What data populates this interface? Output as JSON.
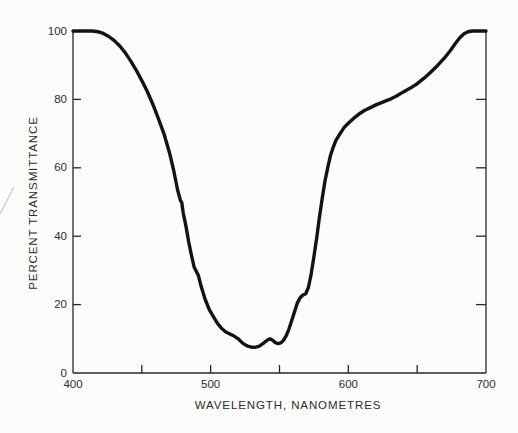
{
  "figure": {
    "background_color": "#fcfcfa",
    "curve_color": "#131313",
    "axis_color": "#272727",
    "text_color": "#2d2d2d",
    "artifact_color": "#a8a49e"
  },
  "chart_data": {
    "type": "line",
    "title": "",
    "xlabel": "WAVELENGTH, NANOMETRES",
    "ylabel": "PERCENT TRANSMITTANCE",
    "xlim": [
      400,
      700
    ],
    "ylim": [
      0,
      100
    ],
    "x_ticks_labeled": [
      400,
      500,
      600,
      700
    ],
    "x_ticks_unlabeled": [
      450,
      550,
      650
    ],
    "y_ticks_labeled": [
      0,
      20,
      40,
      60,
      80,
      100
    ],
    "right_axis_ticks": [
      20,
      40,
      60,
      80
    ],
    "grid": false,
    "legend": null,
    "series": [
      {
        "name": "transmittance-curve",
        "x": [
          400,
          408,
          414,
          418,
          422,
          426,
          430,
          434,
          438,
          442,
          446,
          450,
          454,
          458,
          462,
          466,
          470,
          473,
          476,
          478,
          479,
          480,
          482,
          484,
          486,
          488,
          489,
          491,
          493,
          496,
          499,
          502,
          505,
          508,
          511,
          514,
          517,
          520,
          523,
          526,
          529,
          532,
          535,
          538,
          541,
          543,
          545,
          547,
          549,
          551,
          553,
          555,
          557,
          559,
          561,
          563,
          565,
          567,
          569,
          571,
          573,
          575,
          577,
          579,
          581,
          583,
          585,
          587,
          589,
          591,
          594,
          597,
          600,
          604,
          608,
          612,
          616,
          620,
          625,
          630,
          635,
          640,
          645,
          650,
          655,
          660,
          665,
          670,
          674,
          678,
          681,
          684,
          687,
          690,
          695,
          700
        ],
        "y": [
          100,
          100,
          100,
          99.8,
          99.3,
          98.4,
          97.2,
          95.6,
          93.6,
          91.2,
          88.5,
          85.5,
          82.3,
          78.6,
          74.4,
          70.0,
          64.5,
          59.5,
          53.5,
          50.5,
          49.8,
          47.0,
          43.0,
          38.5,
          34.5,
          31.0,
          30.2,
          28.6,
          25.5,
          21.5,
          18.5,
          16.5,
          14.5,
          13.0,
          12.0,
          11.4,
          10.8,
          10.0,
          8.8,
          8.0,
          7.6,
          7.5,
          7.8,
          8.6,
          9.6,
          10.0,
          9.6,
          8.9,
          8.6,
          8.8,
          9.6,
          11.0,
          13.0,
          15.5,
          18.0,
          20.5,
          22.0,
          22.8,
          23.2,
          25.0,
          29.0,
          34.0,
          39.5,
          45.5,
          51.0,
          56.0,
          60.0,
          63.5,
          66.0,
          68.0,
          70.0,
          71.8,
          73.0,
          74.5,
          75.8,
          76.8,
          77.6,
          78.4,
          79.2,
          80.0,
          81.0,
          82.2,
          83.3,
          84.6,
          86.2,
          88.0,
          90.0,
          92.2,
          94.2,
          96.5,
          98.0,
          99.2,
          99.8,
          100,
          100,
          100
        ]
      }
    ]
  }
}
